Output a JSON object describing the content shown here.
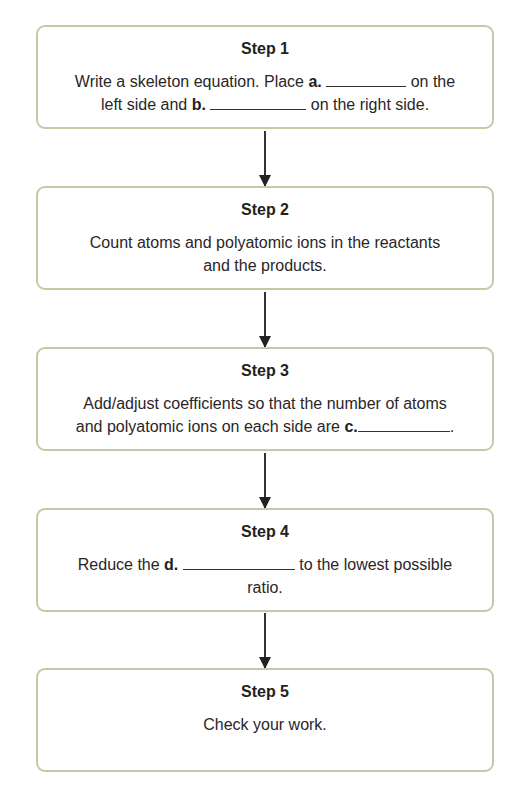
{
  "flowchart": {
    "steps": [
      {
        "title": "Step 1",
        "parts": {
          "t1": "Write a skeleton equation. Place ",
          "label_a": "a.",
          "t2": " on the",
          "t3": "left side and ",
          "label_b": "b.",
          "t4": " on the right side."
        }
      },
      {
        "title": "Step 2",
        "parts": {
          "t1": "Count atoms and polyatomic ions in the reactants",
          "t2": "and the products."
        }
      },
      {
        "title": "Step 3",
        "parts": {
          "t1": "Add/adjust coefficients so that the number of atoms",
          "t2": "and polyatomic ions on each side are ",
          "label_c": "c.",
          "t3": "."
        }
      },
      {
        "title": "Step 4",
        "parts": {
          "t1": "Reduce the ",
          "label_d": "d.",
          "t2": " to the lowest possible",
          "t3": "ratio."
        }
      },
      {
        "title": "Step 5",
        "parts": {
          "t1": "Check your work."
        }
      }
    ],
    "colors": {
      "box_border": "#c9c7a4",
      "text": "#231f20",
      "arrow": "#222222"
    }
  }
}
